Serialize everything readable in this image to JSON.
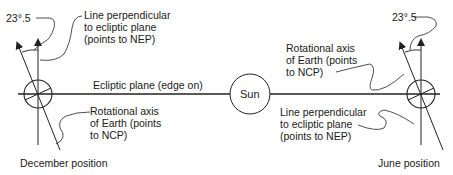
{
  "diagram": {
    "ecliptic_label": "Ecliptic plane (edge on)",
    "sun_label": "Sun",
    "december": {
      "position_label": "December position",
      "angle_label": "23°.5",
      "perpendicular_label": [
        "Line perpendicular",
        "to ecliptic plane",
        "(points to NEP)"
      ],
      "axis_label": [
        "Rotational axis",
        "of Earth (points",
        "to NCP)"
      ]
    },
    "june": {
      "position_label": "June position",
      "angle_label": "23°.5",
      "axis_label": [
        "Rotational axis",
        "of Earth (points",
        "to NCP)"
      ],
      "perpendicular_label": [
        "Line perpendicular",
        "to ecliptic plane",
        "(points to NEP)"
      ]
    },
    "colors": {
      "line": "#222222",
      "background": "#ffffff",
      "text": "#1a1a1a"
    }
  }
}
